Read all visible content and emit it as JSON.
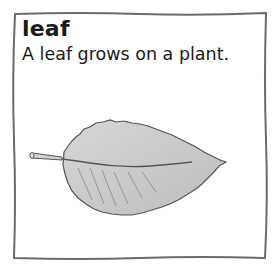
{
  "card": {
    "word": "leaf",
    "sentence": "A leaf grows on a plant.",
    "illustration": "leaf-illustration"
  },
  "colors": {
    "border": "#6b6b6b",
    "text": "#1a1a1a",
    "leaf_fill": "#c8c8c8",
    "leaf_outline": "#555555"
  }
}
